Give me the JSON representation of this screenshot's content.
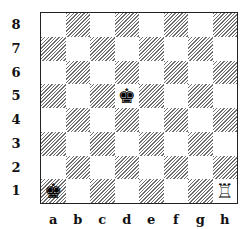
{
  "diagram": {
    "type": "chess-position",
    "files": [
      "a",
      "b",
      "c",
      "d",
      "e",
      "f",
      "g",
      "h"
    ],
    "ranks": [
      "8",
      "7",
      "6",
      "5",
      "4",
      "3",
      "2",
      "1"
    ],
    "pieces": [
      {
        "square": "d5",
        "piece": "black-king",
        "glyph": "♚"
      },
      {
        "square": "a1",
        "piece": "black-king",
        "glyph": "♚"
      },
      {
        "square": "h1",
        "piece": "white-rook",
        "glyph": "♖"
      }
    ]
  }
}
